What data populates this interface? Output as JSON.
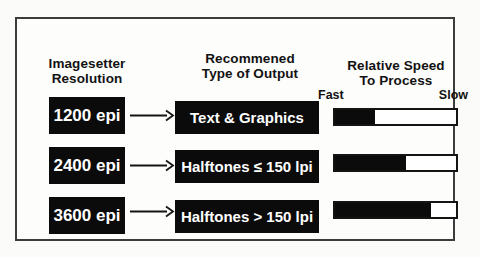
{
  "diagram": {
    "headers": {
      "col1": {
        "line1": "Imagesetter",
        "line2": "Resolution"
      },
      "col2": {
        "line1": "Recommened",
        "line2": "Type of Output"
      },
      "col3": {
        "line1": "Relative Speed",
        "line2": "To Process"
      }
    },
    "speed_scale": {
      "left": "Fast",
      "right": "Slow"
    },
    "rows": [
      {
        "resolution": "1200 epi",
        "output": "Text & Graphics",
        "speed_fill_pct": 33
      },
      {
        "resolution": "2400 epi",
        "output": "Halftones ≤ 150 lpi",
        "speed_fill_pct": 59
      },
      {
        "resolution": "3600 epi",
        "output": "Halftones > 150 lpi",
        "speed_fill_pct": 79
      }
    ],
    "colors": {
      "box_bg": "#0b0b0b",
      "box_text": "#ffffff",
      "bar_fill": "#0b0b0b",
      "bar_border": "#141414",
      "frame_border": "#3c3c3c",
      "page_bg": "#fbfbf9"
    }
  }
}
